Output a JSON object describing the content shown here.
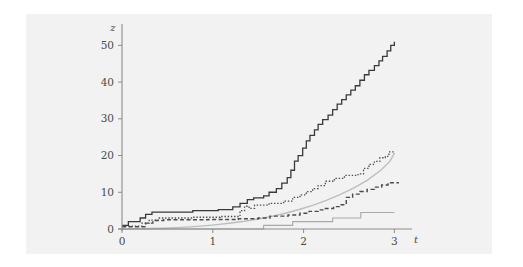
{
  "figure": {
    "background_color": "#ffffff",
    "plot_background_color": "#f2f2f2",
    "axis_color": "#8c8c8c"
  },
  "axes": {
    "x_label": "t",
    "y_label": "z",
    "x_ticks": [
      "0",
      "1",
      "2",
      "3"
    ],
    "y_ticks": [
      "0",
      "10",
      "20",
      "30",
      "40",
      "50"
    ]
  },
  "chart_data": {
    "type": "line",
    "title": "",
    "subtitle": "",
    "xlabel": "t",
    "ylabel": "z",
    "xlim": [
      0,
      3.15
    ],
    "ylim": [
      0,
      55
    ],
    "x_ticks": [
      0,
      1,
      2,
      3
    ],
    "y_ticks": [
      0,
      10,
      20,
      30,
      40,
      50
    ],
    "grid": false,
    "legend": "none",
    "series": [
      {
        "name": "smooth-compensator",
        "style": "solid",
        "color": "#bdbdbd",
        "width": 1.4,
        "step": false,
        "points": [
          [
            0.0,
            0.0
          ],
          [
            0.15,
            0.05
          ],
          [
            0.3,
            0.12
          ],
          [
            0.45,
            0.22
          ],
          [
            0.6,
            0.38
          ],
          [
            0.75,
            0.58
          ],
          [
            0.9,
            0.85
          ],
          [
            1.05,
            1.2
          ],
          [
            1.2,
            1.62
          ],
          [
            1.35,
            2.12
          ],
          [
            1.5,
            2.72
          ],
          [
            1.65,
            3.45
          ],
          [
            1.8,
            4.3
          ],
          [
            1.95,
            5.3
          ],
          [
            2.1,
            6.45
          ],
          [
            2.25,
            7.8
          ],
          [
            2.4,
            9.35
          ],
          [
            2.55,
            11.15
          ],
          [
            2.7,
            13.25
          ],
          [
            2.85,
            16.0
          ],
          [
            2.95,
            18.4
          ],
          [
            3.0,
            20.6
          ]
        ]
      },
      {
        "name": "counting-process-high",
        "style": "solid",
        "color": "#3a3a3a",
        "width": 1.3,
        "step": true,
        "points": [
          [
            0.0,
            1.0
          ],
          [
            0.07,
            1.0
          ],
          [
            0.07,
            2.0
          ],
          [
            0.2,
            2.0
          ],
          [
            0.2,
            3.0
          ],
          [
            0.26,
            3.0
          ],
          [
            0.26,
            4.0
          ],
          [
            0.33,
            4.0
          ],
          [
            0.33,
            4.6
          ],
          [
            0.78,
            4.6
          ],
          [
            0.78,
            5.0
          ],
          [
            1.06,
            5.0
          ],
          [
            1.06,
            5.3
          ],
          [
            1.22,
            5.3
          ],
          [
            1.22,
            6.0
          ],
          [
            1.3,
            6.0
          ],
          [
            1.3,
            7.0
          ],
          [
            1.38,
            7.0
          ],
          [
            1.38,
            8.0
          ],
          [
            1.45,
            8.0
          ],
          [
            1.45,
            8.5
          ],
          [
            1.56,
            8.5
          ],
          [
            1.56,
            9.0
          ],
          [
            1.62,
            9.0
          ],
          [
            1.62,
            10.0
          ],
          [
            1.7,
            10.0
          ],
          [
            1.7,
            11.0
          ],
          [
            1.76,
            11.0
          ],
          [
            1.76,
            12.5
          ],
          [
            1.82,
            12.5
          ],
          [
            1.82,
            14.0
          ],
          [
            1.86,
            14.0
          ],
          [
            1.86,
            16.0
          ],
          [
            1.9,
            16.0
          ],
          [
            1.9,
            18.5
          ],
          [
            1.94,
            18.5
          ],
          [
            1.94,
            20.0
          ],
          [
            1.99,
            20.0
          ],
          [
            1.99,
            22.0
          ],
          [
            2.03,
            22.0
          ],
          [
            2.03,
            24.0
          ],
          [
            2.07,
            24.0
          ],
          [
            2.07,
            25.5
          ],
          [
            2.12,
            25.5
          ],
          [
            2.12,
            27.0
          ],
          [
            2.16,
            27.0
          ],
          [
            2.16,
            28.5
          ],
          [
            2.21,
            28.5
          ],
          [
            2.21,
            29.8
          ],
          [
            2.27,
            29.8
          ],
          [
            2.27,
            31.0
          ],
          [
            2.32,
            31.0
          ],
          [
            2.32,
            32.5
          ],
          [
            2.37,
            32.5
          ],
          [
            2.37,
            34.0
          ],
          [
            2.42,
            34.0
          ],
          [
            2.42,
            35.2
          ],
          [
            2.47,
            35.2
          ],
          [
            2.47,
            36.5
          ],
          [
            2.52,
            36.5
          ],
          [
            2.52,
            37.8
          ],
          [
            2.57,
            37.8
          ],
          [
            2.57,
            39.0
          ],
          [
            2.62,
            39.0
          ],
          [
            2.62,
            40.5
          ],
          [
            2.67,
            40.5
          ],
          [
            2.67,
            42.0
          ],
          [
            2.72,
            42.0
          ],
          [
            2.72,
            43.2
          ],
          [
            2.78,
            43.2
          ],
          [
            2.78,
            44.5
          ],
          [
            2.83,
            44.5
          ],
          [
            2.83,
            45.8
          ],
          [
            2.87,
            45.8
          ],
          [
            2.87,
            47.0
          ],
          [
            2.92,
            47.0
          ],
          [
            2.92,
            48.5
          ],
          [
            2.96,
            48.5
          ],
          [
            2.96,
            50.0
          ],
          [
            3.0,
            50.0
          ],
          [
            3.0,
            51.0
          ]
        ]
      },
      {
        "name": "counting-process-mid-dotted",
        "style": "dotted",
        "color": "#4a4a4a",
        "width": 1.3,
        "step": true,
        "points": [
          [
            0.0,
            0.8
          ],
          [
            0.22,
            0.8
          ],
          [
            0.22,
            1.6
          ],
          [
            0.3,
            1.6
          ],
          [
            0.3,
            2.4
          ],
          [
            0.4,
            2.4
          ],
          [
            0.4,
            3.0
          ],
          [
            0.78,
            3.0
          ],
          [
            0.78,
            3.2
          ],
          [
            1.08,
            3.2
          ],
          [
            1.08,
            3.4
          ],
          [
            1.3,
            3.4
          ],
          [
            1.3,
            5.0
          ],
          [
            1.35,
            5.0
          ],
          [
            1.35,
            6.2
          ],
          [
            1.4,
            6.2
          ],
          [
            1.4,
            5.6
          ],
          [
            1.46,
            5.6
          ],
          [
            1.46,
            6.5
          ],
          [
            1.62,
            6.5
          ],
          [
            1.62,
            7.0
          ],
          [
            1.78,
            7.0
          ],
          [
            1.78,
            7.6
          ],
          [
            1.88,
            7.6
          ],
          [
            1.88,
            8.6
          ],
          [
            1.96,
            8.6
          ],
          [
            1.96,
            9.3
          ],
          [
            2.03,
            9.3
          ],
          [
            2.03,
            10.2
          ],
          [
            2.1,
            10.2
          ],
          [
            2.1,
            11.0
          ],
          [
            2.16,
            11.0
          ],
          [
            2.16,
            11.8
          ],
          [
            2.24,
            11.8
          ],
          [
            2.24,
            13.0
          ],
          [
            2.34,
            13.0
          ],
          [
            2.34,
            13.8
          ],
          [
            2.45,
            13.8
          ],
          [
            2.45,
            14.6
          ],
          [
            2.6,
            14.6
          ],
          [
            2.6,
            15.0
          ],
          [
            2.66,
            15.0
          ],
          [
            2.66,
            16.5
          ],
          [
            2.72,
            16.5
          ],
          [
            2.72,
            17.6
          ],
          [
            2.78,
            17.6
          ],
          [
            2.78,
            18.4
          ],
          [
            2.84,
            18.4
          ],
          [
            2.84,
            19.4
          ],
          [
            2.9,
            19.4
          ],
          [
            2.9,
            19.8
          ],
          [
            2.94,
            19.8
          ],
          [
            2.94,
            21.0
          ],
          [
            3.0,
            21.0
          ],
          [
            3.0,
            20.6
          ]
        ]
      },
      {
        "name": "counting-process-low-dashed",
        "style": "dashed",
        "color": "#4a4a4a",
        "width": 1.4,
        "step": true,
        "points": [
          [
            0.0,
            0.6
          ],
          [
            0.26,
            0.6
          ],
          [
            0.26,
            1.6
          ],
          [
            0.34,
            1.6
          ],
          [
            0.34,
            2.3
          ],
          [
            0.46,
            2.3
          ],
          [
            0.46,
            2.5
          ],
          [
            0.95,
            2.5
          ],
          [
            0.95,
            2.6
          ],
          [
            1.28,
            2.6
          ],
          [
            1.28,
            2.8
          ],
          [
            1.5,
            2.8
          ],
          [
            1.5,
            3.0
          ],
          [
            1.63,
            3.0
          ],
          [
            1.63,
            3.5
          ],
          [
            1.83,
            3.5
          ],
          [
            1.83,
            3.8
          ],
          [
            1.96,
            3.8
          ],
          [
            1.96,
            4.3
          ],
          [
            2.06,
            4.3
          ],
          [
            2.06,
            4.8
          ],
          [
            2.16,
            4.8
          ],
          [
            2.16,
            5.2
          ],
          [
            2.24,
            5.2
          ],
          [
            2.24,
            5.6
          ],
          [
            2.33,
            5.6
          ],
          [
            2.33,
            6.1
          ],
          [
            2.4,
            6.1
          ],
          [
            2.4,
            6.6
          ],
          [
            2.47,
            6.6
          ],
          [
            2.47,
            8.6
          ],
          [
            2.54,
            8.6
          ],
          [
            2.54,
            9.5
          ],
          [
            2.62,
            9.5
          ],
          [
            2.62,
            10.2
          ],
          [
            2.7,
            10.2
          ],
          [
            2.7,
            10.8
          ],
          [
            2.78,
            10.8
          ],
          [
            2.78,
            11.4
          ],
          [
            2.86,
            11.4
          ],
          [
            2.86,
            12.0
          ],
          [
            2.93,
            12.0
          ],
          [
            2.93,
            12.6
          ],
          [
            3.0,
            12.6
          ],
          [
            3.05,
            12.6
          ]
        ]
      },
      {
        "name": "counting-process-flat-gray",
        "style": "solid",
        "color": "#a8a8a8",
        "width": 1.1,
        "step": true,
        "points": [
          [
            0.0,
            0.0
          ],
          [
            1.56,
            0.0
          ],
          [
            1.56,
            1.0
          ],
          [
            1.88,
            1.0
          ],
          [
            1.88,
            2.0
          ],
          [
            2.32,
            2.0
          ],
          [
            2.32,
            3.0
          ],
          [
            2.63,
            3.0
          ],
          [
            2.63,
            4.5
          ],
          [
            3.0,
            4.5
          ]
        ]
      }
    ]
  }
}
